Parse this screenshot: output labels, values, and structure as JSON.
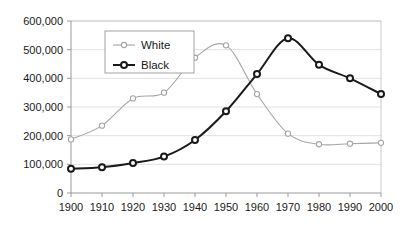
{
  "chart_data": {
    "type": "line",
    "title": "",
    "subtitle": "",
    "xlabel": "",
    "ylabel": "",
    "x": [
      1900,
      1910,
      1920,
      1930,
      1940,
      1950,
      1960,
      1970,
      1980,
      1990,
      2000
    ],
    "categories": [
      "1900",
      "1910",
      "1920",
      "1930",
      "1940",
      "1950",
      "1960",
      "1970",
      "1980",
      "1990",
      "2000"
    ],
    "series": [
      {
        "name": "White",
        "color": "#a6a6a6",
        "marker": "open-circle",
        "values": [
          187000,
          235000,
          330000,
          350000,
          472000,
          515000,
          345000,
          207000,
          170000,
          172000,
          175000
        ]
      },
      {
        "name": "Black",
        "color": "#1a1a1a",
        "marker": "open-circle",
        "values": [
          85000,
          90000,
          105000,
          127000,
          185000,
          285000,
          415000,
          540000,
          447000,
          400000,
          345000
        ]
      }
    ],
    "xlim": [
      1900,
      2000
    ],
    "ylim": [
      0,
      600000
    ],
    "ytick_values": [
      0,
      100000,
      200000,
      300000,
      400000,
      500000,
      600000
    ],
    "ytick_labels": [
      "0",
      "100,000",
      "200,000",
      "300,000",
      "400,000",
      "500,000",
      "600,000"
    ],
    "xtick_labels": [
      "1900",
      "1910",
      "1920",
      "1930",
      "1940",
      "1950",
      "1960",
      "1970",
      "1980",
      "1990",
      "2000"
    ],
    "grid": "horizontal",
    "legend_position": "top-left-inside",
    "legend_entries": [
      {
        "label": "White",
        "color": "#a6a6a6"
      },
      {
        "label": "Black",
        "color": "#1a1a1a"
      }
    ]
  }
}
